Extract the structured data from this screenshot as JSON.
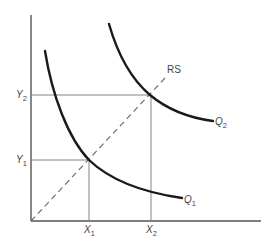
{
  "diagram": {
    "type": "isoquant-diagram",
    "axes": {
      "origin": [
        31,
        221
      ],
      "y_axis_top": [
        31,
        15
      ],
      "x_axis_end": [
        261,
        221
      ]
    },
    "ray": {
      "label": "RS",
      "from": [
        31,
        221
      ],
      "to": [
        165,
        78
      ]
    },
    "curves": [
      {
        "id": "Q1",
        "label_main": "Q",
        "label_sub": "1",
        "passes_through": [
          [
            45,
            51
          ],
          [
            54,
            95
          ],
          [
            89,
            160
          ],
          [
            151,
            191
          ],
          [
            182,
            198
          ]
        ]
      },
      {
        "id": "Q2",
        "label_main": "Q",
        "label_sub": "2",
        "passes_through": [
          [
            109,
            24
          ],
          [
            150,
            95
          ],
          [
            213,
            121
          ]
        ]
      }
    ],
    "guides": {
      "Y1": {
        "label_main": "Y",
        "label_sub": "1",
        "y": 160
      },
      "Y2": {
        "label_main": "Y",
        "label_sub": "2",
        "y": 95
      },
      "X1": {
        "label_main": "X",
        "label_sub": "1",
        "x": 89
      },
      "X2": {
        "label_main": "X",
        "label_sub": "2",
        "x": 151
      }
    },
    "intersections": [
      {
        "curve": "Q1",
        "point": [
          89,
          160
        ],
        "x_label": "X1",
        "y_label": "Y1"
      },
      {
        "curve": "Q2",
        "point": [
          150,
          95
        ],
        "x_label": "X2",
        "y_label": "Y2"
      }
    ]
  }
}
